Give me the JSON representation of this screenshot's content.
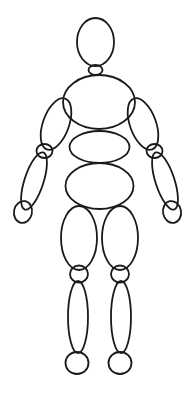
{
  "diagram": {
    "style": "line-art",
    "orientation": "front-facing-standing",
    "background_color": "#ffffff",
    "stroke_color": "#1a1a1a",
    "fill_color": "none",
    "canvas": {
      "width": 191,
      "height": 393
    },
    "part_count": 19,
    "symmetry": "bilateral-left-right"
  },
  "parts": [
    {
      "id": "head",
      "label": "Head",
      "shape": "ellipse",
      "cx": 95.5,
      "cy": 42,
      "rx": 18.5,
      "ry": 24,
      "rotation": 0,
      "stroke_width": 1.8
    },
    {
      "id": "neck",
      "label": "Neck",
      "shape": "ellipse",
      "cx": 95.5,
      "cy": 70,
      "rx": 7,
      "ry": 5,
      "rotation": 0,
      "stroke_width": 1.8
    },
    {
      "id": "chest",
      "label": "Chest",
      "shape": "ellipse",
      "cx": 99,
      "cy": 102,
      "rx": 36,
      "ry": 27,
      "rotation": 0,
      "stroke_width": 1.8
    },
    {
      "id": "waist",
      "label": "Waist",
      "shape": "ellipse",
      "cx": 99.5,
      "cy": 147,
      "rx": 30,
      "ry": 16,
      "rotation": 0,
      "stroke_width": 1.8
    },
    {
      "id": "pelvis",
      "label": "Pelvis",
      "shape": "ellipse",
      "cx": 99.5,
      "cy": 186,
      "rx": 34,
      "ry": 23,
      "rotation": 0,
      "stroke_width": 1.8
    },
    {
      "id": "upper-arm-left",
      "label": "Left Upper Arm",
      "shape": "ellipse",
      "cx": 56,
      "cy": 124,
      "rx": 13,
      "ry": 27,
      "rotation": 20,
      "stroke_width": 1.8
    },
    {
      "id": "elbow-left",
      "label": "Left Elbow",
      "shape": "ellipse",
      "cx": 44.5,
      "cy": 151,
      "rx": 8,
      "ry": 7,
      "rotation": 0,
      "stroke_width": 1.8
    },
    {
      "id": "forearm-left",
      "label": "Left Forearm",
      "shape": "ellipse",
      "cx": 34,
      "cy": 181,
      "rx": 9.5,
      "ry": 30,
      "rotation": 18,
      "stroke_width": 1.8
    },
    {
      "id": "hand-left",
      "label": "Left Hand",
      "shape": "ellipse",
      "cx": 23,
      "cy": 212,
      "rx": 9,
      "ry": 11,
      "rotation": 12,
      "stroke_width": 1.8
    },
    {
      "id": "upper-arm-right",
      "label": "Right Upper Arm",
      "shape": "ellipse",
      "cx": 143,
      "cy": 124,
      "rx": 13,
      "ry": 27,
      "rotation": -20,
      "stroke_width": 1.8
    },
    {
      "id": "elbow-right",
      "label": "Right Elbow",
      "shape": "ellipse",
      "cx": 154.5,
      "cy": 151,
      "rx": 8,
      "ry": 7,
      "rotation": 0,
      "stroke_width": 1.8
    },
    {
      "id": "forearm-right",
      "label": "Right Forearm",
      "shape": "ellipse",
      "cx": 165,
      "cy": 181,
      "rx": 9.5,
      "ry": 30,
      "rotation": -18,
      "stroke_width": 1.8
    },
    {
      "id": "hand-right",
      "label": "Right Hand",
      "shape": "ellipse",
      "cx": 172,
      "cy": 212,
      "rx": 9,
      "ry": 11,
      "rotation": -12,
      "stroke_width": 1.8
    },
    {
      "id": "thigh-left",
      "label": "Left Thigh",
      "shape": "ellipse",
      "cx": 79,
      "cy": 238,
      "rx": 18,
      "ry": 32,
      "rotation": 0,
      "stroke_width": 1.8
    },
    {
      "id": "knee-left",
      "label": "Left Knee",
      "shape": "ellipse",
      "cx": 79,
      "cy": 274,
      "rx": 9,
      "ry": 8.5,
      "rotation": 0,
      "stroke_width": 1.8
    },
    {
      "id": "shin-left",
      "label": "Left Lower Leg",
      "shape": "ellipse",
      "cx": 78,
      "cy": 317,
      "rx": 10,
      "ry": 36,
      "rotation": 0,
      "stroke_width": 1.8
    },
    {
      "id": "foot-left",
      "label": "Left Foot",
      "shape": "ellipse",
      "cx": 77,
      "cy": 363,
      "rx": 11.5,
      "ry": 11,
      "rotation": 0,
      "stroke_width": 1.8
    },
    {
      "id": "thigh-right",
      "label": "Right Thigh",
      "shape": "ellipse",
      "cx": 120,
      "cy": 238,
      "rx": 18,
      "ry": 32,
      "rotation": 0,
      "stroke_width": 1.8
    },
    {
      "id": "knee-right",
      "label": "Right Knee",
      "shape": "ellipse",
      "cx": 120,
      "cy": 274,
      "rx": 9,
      "ry": 8.5,
      "rotation": 0,
      "stroke_width": 1.8
    },
    {
      "id": "shin-right",
      "label": "Right Lower Leg",
      "shape": "ellipse",
      "cx": 121,
      "cy": 317,
      "rx": 10,
      "ry": 36,
      "rotation": 0,
      "stroke_width": 1.8
    },
    {
      "id": "foot-right",
      "label": "Right Foot",
      "shape": "ellipse",
      "cx": 120,
      "cy": 363,
      "rx": 11.5,
      "ry": 11,
      "rotation": 0,
      "stroke_width": 1.8
    }
  ]
}
